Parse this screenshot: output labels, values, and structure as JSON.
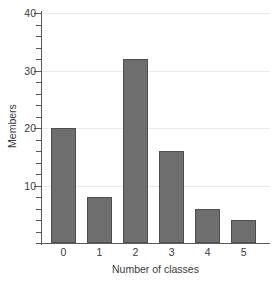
{
  "chart_data": {
    "type": "bar",
    "title": "",
    "categories": [
      "0",
      "1",
      "2",
      "3",
      "4",
      "5"
    ],
    "values": [
      20,
      8,
      32,
      16,
      6,
      4
    ],
    "xlabel": "Number of classes",
    "ylabel": "Members",
    "ylim": [
      0,
      40
    ],
    "ytick_labels": [
      "10",
      "20",
      "30",
      "40"
    ],
    "ytick_values": [
      10,
      20,
      30,
      40
    ],
    "yminor_step": 2,
    "grid": "horizontal",
    "legend": "none",
    "bar_color": "#6e6e6e",
    "bar_edge_color": "#4f4f4f",
    "gridline_color": "#e9e9e9",
    "axis_color": "#5a5a5a",
    "text_color": "#3a3a3a"
  }
}
